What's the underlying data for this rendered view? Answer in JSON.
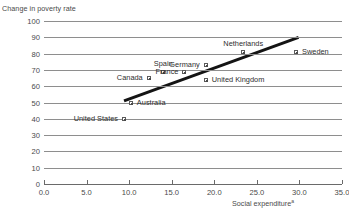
{
  "chart_data": {
    "type": "scatter",
    "title": "",
    "xlabel": "Social expenditure",
    "xlabel_superscript": "a",
    "ylabel": "Change in poverty rate",
    "xlim": [
      0.0,
      35.0
    ],
    "ylim": [
      0,
      100
    ],
    "xticks": [
      "0.0",
      "5.0",
      "10.0",
      "15.0",
      "20.0",
      "25.0",
      "30.0",
      "35.0"
    ],
    "yticks": [
      "0",
      "10",
      "20",
      "30",
      "40",
      "50",
      "60",
      "70",
      "80",
      "90",
      "100"
    ],
    "grid": "horizontal",
    "legend": "none",
    "points": [
      {
        "label": "United States",
        "x": 9.4,
        "y": 40,
        "label_pos": "left"
      },
      {
        "label": "Australia",
        "x": 10.2,
        "y": 50,
        "label_pos": "right"
      },
      {
        "label": "Canada",
        "x": 12.3,
        "y": 65,
        "label_pos": "left"
      },
      {
        "label": "Spain",
        "x": 14.0,
        "y": 69,
        "label_pos": "above"
      },
      {
        "label": "France",
        "x": 16.5,
        "y": 69,
        "label_pos": "left"
      },
      {
        "label": "Germany",
        "x": 19.0,
        "y": 73,
        "label_pos": "left"
      },
      {
        "label": "United Kingdom",
        "x": 19.0,
        "y": 64,
        "label_pos": "right"
      },
      {
        "label": "Netherlands",
        "x": 23.4,
        "y": 81,
        "label_pos": "above"
      },
      {
        "label": "Sweden",
        "x": 29.6,
        "y": 81,
        "label_pos": "right"
      }
    ],
    "trendline": {
      "name": "linear-fit",
      "x1": 9.4,
      "y1": 51,
      "x2": 29.9,
      "y2": 90,
      "color": "#141414"
    },
    "colors": {
      "gridline": "#8e8e8e",
      "axis": "#6a6a6a",
      "marker_fill": "#ffffff",
      "marker_edge": "#4a4a4a",
      "text": "#3a3a3a"
    }
  }
}
